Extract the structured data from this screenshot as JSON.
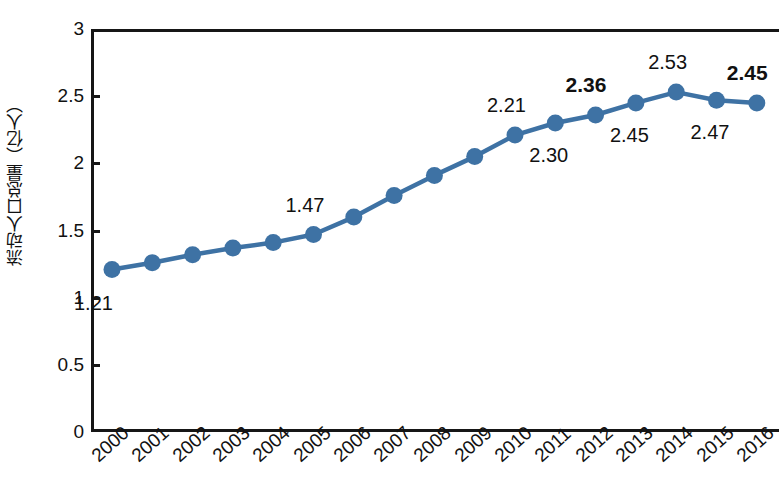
{
  "chart_data": {
    "type": "line",
    "title": "",
    "xlabel": "",
    "ylabel": "流动人口总量（亿人）",
    "ylim": [
      0,
      3
    ],
    "ytick_labels": [
      "3",
      "2.5",
      "2",
      "1.5",
      "1",
      "0.5",
      "0"
    ],
    "ytick_values": [
      3,
      2.5,
      2,
      1.5,
      1,
      0.5,
      0
    ],
    "grid": false,
    "legend": "none",
    "marker": "circle",
    "series_color": "#3E72A4",
    "categories": [
      "2000",
      "2001",
      "2002",
      "2003",
      "2004",
      "2005",
      "2006",
      "2007",
      "2008",
      "2009",
      "2010",
      "2011",
      "2012",
      "2013",
      "2014",
      "2015",
      "2016"
    ],
    "values": [
      1.21,
      1.26,
      1.32,
      1.37,
      1.41,
      1.47,
      1.6,
      1.76,
      1.91,
      2.05,
      2.21,
      2.3,
      2.36,
      2.45,
      2.53,
      2.47,
      2.45
    ],
    "point_labels": [
      {
        "category": "2000",
        "value": 1.21,
        "text": "1.21",
        "bold": false,
        "position": "below-left"
      },
      {
        "category": "2005",
        "value": 1.47,
        "text": "1.47",
        "bold": false,
        "position": "above"
      },
      {
        "category": "2010",
        "value": 2.21,
        "text": "2.21",
        "bold": false,
        "position": "above"
      },
      {
        "category": "2011",
        "value": 2.3,
        "text": "2.30",
        "bold": false,
        "position": "below"
      },
      {
        "category": "2012",
        "value": 2.36,
        "text": "2.36",
        "bold": true,
        "position": "above"
      },
      {
        "category": "2013",
        "value": 2.45,
        "text": "2.45",
        "bold": false,
        "position": "below"
      },
      {
        "category": "2014",
        "value": 2.53,
        "text": "2.53",
        "bold": false,
        "position": "above"
      },
      {
        "category": "2015",
        "value": 2.47,
        "text": "2.47",
        "bold": false,
        "position": "below"
      },
      {
        "category": "2016",
        "value": 2.45,
        "text": "2.45",
        "bold": true,
        "position": "above"
      }
    ]
  },
  "axes": {
    "y_title": "流动人口总量（亿人）",
    "y_ticks": [
      "3",
      "2.5",
      "2",
      "1.5",
      "1",
      "0.5",
      "0"
    ],
    "x_ticks": [
      "2000",
      "2001",
      "2002",
      "2003",
      "2004",
      "2005",
      "2006",
      "2007",
      "2008",
      "2009",
      "2010",
      "2011",
      "2012",
      "2013",
      "2014",
      "2015",
      "2016"
    ]
  },
  "style": {
    "series_color": "#3E72A4",
    "axis_color": "#161616",
    "background": "#ffffff",
    "text_color": "#111111"
  }
}
